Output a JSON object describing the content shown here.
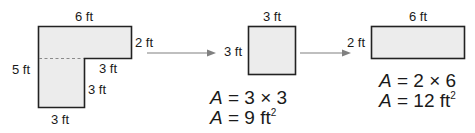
{
  "colors": {
    "fill": "#ececec",
    "stroke": "#222222",
    "arrow": "#808080",
    "dash": "#8a8a8a"
  },
  "lshape": {
    "top": "6 ft",
    "right_short": "2 ft",
    "left": "5 ft",
    "inner_horizontal": "3 ft",
    "inner_vertical": "3 ft",
    "bottom": "3 ft"
  },
  "square": {
    "top": "3 ft",
    "left": "3 ft",
    "eq1": {
      "var": "A",
      "rest": " = 3 × 3"
    },
    "eq2": {
      "var": "A",
      "rest": " = 9 ft",
      "sup": "2"
    }
  },
  "rectangle": {
    "top": "6 ft",
    "left": "2 ft",
    "eq1": {
      "var": "A",
      "rest": " = 2 × 6"
    },
    "eq2": {
      "var": "A",
      "rest": " = 12 ft",
      "sup": "2"
    }
  }
}
